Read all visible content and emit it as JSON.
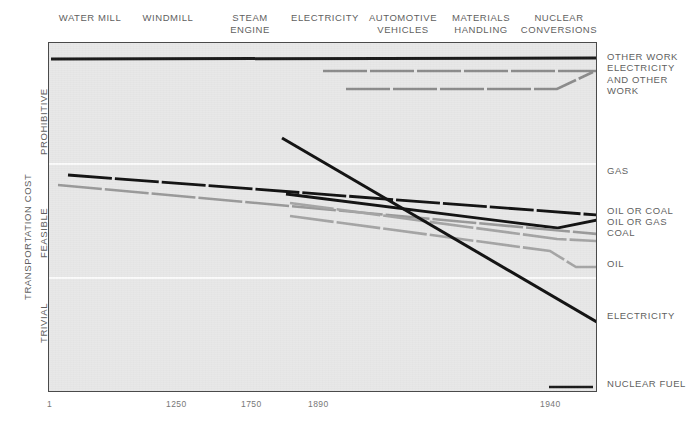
{
  "chart_data": {
    "type": "line",
    "title": "",
    "xlabel": "",
    "ylabel": "TRANSPORTATION COST",
    "grid": true,
    "legend_position": "right-inline",
    "x_axis": {
      "ticks": [
        "1",
        "1250",
        "1750",
        "1890",
        "1940"
      ],
      "tick_values": [
        1,
        1250,
        1750,
        1890,
        1940
      ],
      "tick_px": [
        50,
        178,
        253,
        320,
        552
      ]
    },
    "y_axis": {
      "categories": [
        "PROHIBITIVE",
        "FEASIBLE",
        "TRIVIAL"
      ],
      "band_boundaries_px": [
        163,
        277
      ],
      "inverted": true
    },
    "era_headers": [
      {
        "label": "WATER MILL",
        "center_px": 90
      },
      {
        "label": "WINDMILL",
        "center_px": 168
      },
      {
        "label": "STEAM\nENGINE",
        "center_px": 250
      },
      {
        "label": "ELECTRICITY",
        "center_px": 325
      },
      {
        "label": "AUTOMOTIVE\nVEHICLES",
        "center_px": 403
      },
      {
        "label": "MATERIALS\nHANDLING",
        "center_px": 481
      },
      {
        "label": "NUCLEAR\nCONVERSIONS",
        "center_px": 559
      }
    ],
    "series": [
      {
        "name": "OTHER WORK",
        "color": "#1a1a1a",
        "style": "solid",
        "width": 3.0,
        "label_y_px": 56,
        "points": [
          [
            50,
            58
          ],
          [
            596,
            57
          ]
        ]
      },
      {
        "name": "ELECTRICITY\nAND OTHER\nWORK",
        "color": "#8c8c8c",
        "style": "dashed",
        "width": 2.6,
        "label_y_px": 67,
        "points": [
          [
            322,
            70
          ],
          [
            596,
            70
          ]
        ]
      },
      {
        "name": "",
        "color": "#8c8c8c",
        "style": "dashed",
        "width": 2.6,
        "label_y_px": null,
        "points": [
          [
            345,
            88
          ],
          [
            556,
            88
          ],
          [
            592,
            71
          ]
        ]
      },
      {
        "name": "GAS",
        "color": "#121212",
        "style": "dashed",
        "width": 2.8,
        "label_y_px": 170,
        "points": [
          [
            67,
            174
          ],
          [
            596,
            214
          ]
        ]
      },
      {
        "name": "OIL OR COAL",
        "color": "#121212",
        "style": "solid",
        "width": 2.8,
        "label_y_px": 209,
        "points": [
          [
            285,
            193
          ],
          [
            556,
            227
          ],
          [
            596,
            219
          ]
        ]
      },
      {
        "name": "OIL OR GAS",
        "color": "#9a9a9a",
        "style": "dashed",
        "width": 2.6,
        "label_y_px": 226,
        "points": [
          [
            57,
            184
          ],
          [
            596,
            233
          ]
        ]
      },
      {
        "name": "COAL",
        "color": "#a5a5a5",
        "style": "dashed",
        "width": 2.6,
        "label_y_px": 236,
        "points": [
          [
            289,
            202
          ],
          [
            556,
            238
          ],
          [
            596,
            240
          ]
        ]
      },
      {
        "name": "OIL",
        "color": "#a5a5a5",
        "style": "dashed",
        "width": 2.6,
        "label_y_px": 262,
        "points": [
          [
            289,
            215
          ],
          [
            549,
            250
          ],
          [
            575,
            266
          ],
          [
            596,
            266
          ]
        ]
      },
      {
        "name": "ELECTRICITY",
        "color": "#121212",
        "style": "solid",
        "width": 3.0,
        "label_y_px": 315,
        "points": [
          [
            281,
            137
          ],
          [
            596,
            321
          ]
        ]
      },
      {
        "name": "NUCLEAR FUEL",
        "color": "#1a1a1a",
        "style": "dashed",
        "width": 2.6,
        "label_y_px": 383,
        "points": [
          [
            548,
            386
          ],
          [
            596,
            386
          ]
        ]
      }
    ]
  }
}
